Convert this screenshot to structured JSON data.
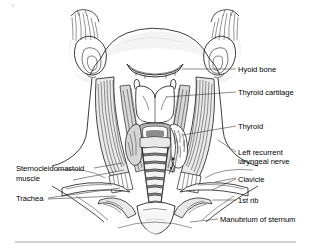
{
  "figure": {
    "background_color": "#ffffff",
    "ink_color": "#1a1a1a",
    "leader_color": "#2e2e2e",
    "rule_color": "#8d8d8d",
    "width": 311,
    "height": 248
  },
  "labels_right": [
    {
      "id": "hyoid-bone",
      "text": "Hyoid bone"
    },
    {
      "id": "thyroid-cartilage",
      "text": "Thyroid cartilage"
    },
    {
      "id": "thyroid",
      "text": "Thyroid"
    },
    {
      "id": "left-recurrent-laryngeal-nerve-line1",
      "text": "Left recurrent"
    },
    {
      "id": "left-recurrent-laryngeal-nerve-line2",
      "text": "laryngeal nerve"
    },
    {
      "id": "clavicle",
      "text": "Clavicle"
    },
    {
      "id": "first-rib",
      "text": "1st rib"
    },
    {
      "id": "manubrium-of-sternum",
      "text": "Manubrium of sternum"
    }
  ],
  "labels_left": [
    {
      "id": "sternocleidomastoid-muscle-line1",
      "text": "Sternocleidomastoid"
    },
    {
      "id": "sternocleidomastoid-muscle-line2",
      "text": "muscle"
    },
    {
      "id": "trachea",
      "text": "Trachea"
    }
  ]
}
